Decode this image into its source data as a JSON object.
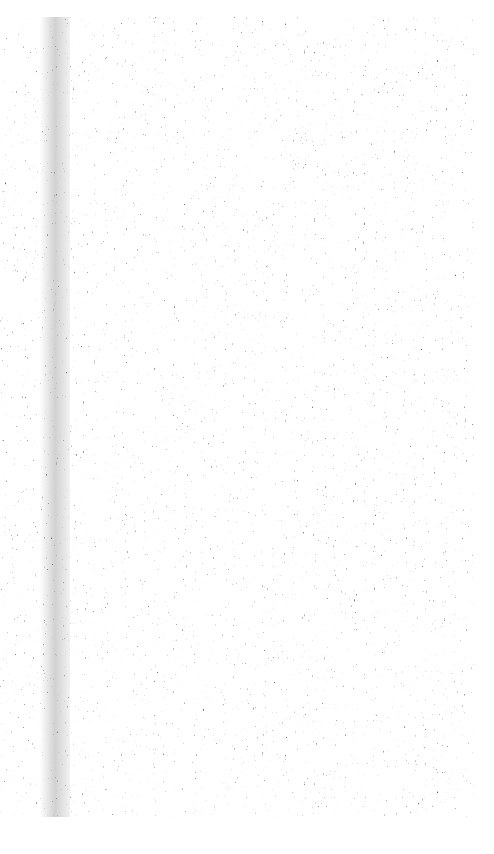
{
  "page": {
    "description": "Scanned page with dense speckled noise texture; no legible text",
    "background_color": "#ffffff",
    "ink_color": "#1a1a1a"
  }
}
